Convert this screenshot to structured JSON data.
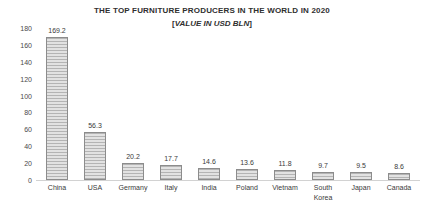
{
  "chart_data": {
    "type": "bar",
    "title": "THE TOP FURNITURE PRODUCERS IN THE WORLD IN 2020",
    "subtitle": "[VALUE IN USD BLN]",
    "subtitle_bracket_left": "[",
    "subtitle_inner": "VALUE IN USD BLN",
    "subtitle_bracket_right": "]",
    "xlabel": "",
    "ylabel": "",
    "ylim": [
      0,
      180
    ],
    "ytick_step": 20,
    "grid": false,
    "legend": false,
    "categories": [
      "China",
      "USA",
      "Germany",
      "Italy",
      "India",
      "Poland",
      "Vietnam",
      "South Korea",
      "Japan",
      "Canada"
    ],
    "values": [
      169.2,
      56.3,
      20.2,
      17.7,
      14.6,
      13.6,
      11.8,
      9.7,
      9.5,
      8.6
    ],
    "value_labels": [
      "169.2",
      "56.3",
      "20.2",
      "17.7",
      "14.6",
      "13.6",
      "11.8",
      "9.7",
      "9.5",
      "8.6"
    ],
    "category_lines": [
      [
        "China"
      ],
      [
        "USA"
      ],
      [
        "Germany"
      ],
      [
        "Italy"
      ],
      [
        "India"
      ],
      [
        "Poland"
      ],
      [
        "Vietnam"
      ],
      [
        "South",
        "Korea"
      ],
      [
        "Japan"
      ],
      [
        "Canada"
      ]
    ],
    "yticks": [
      "180",
      "160",
      "140",
      "120",
      "100",
      "80",
      "60",
      "40",
      "20",
      "0"
    ],
    "ytick_values": [
      180,
      160,
      140,
      120,
      100,
      80,
      60,
      40,
      20,
      0
    ],
    "colors": {
      "bar_fill_light": "#e2e2e2",
      "bar_fill_dark": "#b4b4b4",
      "bar_border": "#8c8c8c",
      "axis": "#d2d2d2",
      "text": "#3a3a3a",
      "background": "#ffffff"
    }
  }
}
